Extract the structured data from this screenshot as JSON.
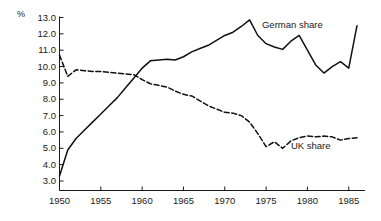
{
  "chart_data": {
    "type": "line",
    "title": "",
    "subtitle": "",
    "xlabel": "",
    "ylabel": "%",
    "xlim": [
      1950,
      1986
    ],
    "ylim": [
      3.0,
      13.0
    ],
    "grid": false,
    "legend_position": "inline-annotation",
    "x_ticks": [
      1950,
      1955,
      1960,
      1965,
      1970,
      1975,
      1980,
      1985
    ],
    "x_tick_labels": [
      "1950",
      "1955",
      "1960",
      "1965",
      "1970",
      "1975",
      "1980",
      "1985"
    ],
    "y_ticks": [
      3.0,
      4.0,
      5.0,
      6.0,
      7.0,
      8.0,
      9.0,
      10.0,
      11.0,
      12.0,
      13.0
    ],
    "y_tick_labels": [
      "3.0",
      "4.0",
      "5.0",
      "6.0",
      "7.0",
      "8.0",
      "9.0",
      "10.0",
      "11.0",
      "12.0",
      "13.0"
    ],
    "x": [
      1950,
      1951,
      1952,
      1953,
      1954,
      1955,
      1956,
      1957,
      1958,
      1959,
      1960,
      1961,
      1962,
      1963,
      1964,
      1965,
      1966,
      1967,
      1968,
      1969,
      1970,
      1971,
      1972,
      1973,
      1974,
      1975,
      1976,
      1977,
      1978,
      1979,
      1980,
      1981,
      1982,
      1983,
      1984,
      1985,
      1986
    ],
    "series": [
      {
        "name": "German share",
        "style": "solid",
        "color": "#111111",
        "values": [
          3.3,
          4.9,
          5.6,
          6.1,
          6.6,
          7.1,
          7.6,
          8.1,
          8.7,
          9.3,
          9.9,
          10.35,
          10.4,
          10.45,
          10.4,
          10.6,
          10.9,
          11.1,
          11.3,
          11.6,
          11.9,
          12.1,
          12.45,
          12.85,
          11.9,
          11.4,
          11.2,
          11.05,
          11.55,
          11.9,
          11.0,
          10.1,
          9.6,
          10.0,
          10.3,
          9.9,
          12.5
        ]
      },
      {
        "name": "UK share",
        "style": "dashed",
        "color": "#111111",
        "values": [
          10.7,
          9.4,
          9.8,
          9.75,
          9.7,
          9.7,
          9.65,
          9.6,
          9.55,
          9.5,
          9.2,
          8.95,
          8.85,
          8.75,
          8.5,
          8.3,
          8.2,
          7.9,
          7.6,
          7.4,
          7.2,
          7.15,
          7.0,
          6.6,
          5.9,
          5.1,
          5.4,
          5.0,
          5.45,
          5.65,
          5.75,
          5.7,
          5.75,
          5.7,
          5.5,
          5.6,
          5.65
        ]
      }
    ],
    "annotations": [
      {
        "text": "German share",
        "x": 1974.5,
        "y": 12.5
      },
      {
        "text": "UK share",
        "x": 1978.0,
        "y": 5.05
      }
    ]
  }
}
